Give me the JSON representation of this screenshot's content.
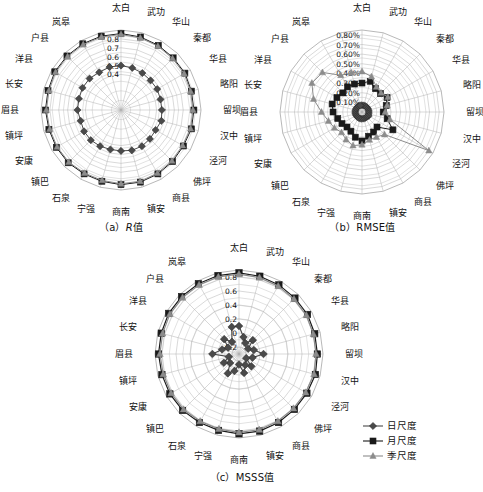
{
  "figure": {
    "panels": [
      {
        "id": "a",
        "caption_prefix": "（a）",
        "caption_metric": "R",
        "caption_suffix": "值"
      },
      {
        "id": "b",
        "caption_prefix": "（b）",
        "caption_metric": "RMSE",
        "caption_suffix": "值"
      },
      {
        "id": "c",
        "caption_prefix": "（c）",
        "caption_metric": "MSSS",
        "caption_suffix": "值"
      }
    ]
  },
  "legend": {
    "position": "bottom-right",
    "items": [
      {
        "label": "日尺度",
        "marker": "diamond-icon",
        "color": "#4a4a4a"
      },
      {
        "label": "月尺度",
        "marker": "square-icon",
        "color": "#1a1a1a"
      },
      {
        "label": "季尺度",
        "marker": "triangle-icon",
        "color": "#8c8c8c"
      }
    ]
  },
  "chart_data": [
    {
      "type": "radar",
      "id": "a",
      "title": "（a）R值",
      "grid": true,
      "legend_position": "external-bottom-right",
      "categories": [
        "太白",
        "武功",
        "华山",
        "秦都",
        "华县",
        "略阳",
        "留坝",
        "汉中",
        "泾河",
        "佛坪",
        "商县",
        "镇安",
        "商南",
        "宁强",
        "石泉",
        "镇巴",
        "安康",
        "镇坪",
        "眉县",
        "长安",
        "洋县",
        "户县",
        "岚皋",
        "太白2"
      ],
      "tick_labels": [
        "0.8",
        "0.7",
        "0.6",
        "0.5",
        "0.4"
      ],
      "rlim": [
        0,
        0.9
      ],
      "rticks": [
        0.8,
        0.7,
        0.6,
        0.5,
        0.4
      ],
      "series": [
        {
          "name": "日尺度",
          "marker": "diamond",
          "color": "#4a4a4a",
          "values": [
            0.5,
            0.49,
            0.48,
            0.47,
            0.47,
            0.46,
            0.46,
            0.47,
            0.45,
            0.46,
            0.47,
            0.47,
            0.46,
            0.46,
            0.47,
            0.48,
            0.48,
            0.47,
            0.49,
            0.49,
            0.5,
            0.5,
            0.49,
            0.5
          ]
        },
        {
          "name": "月尺度",
          "marker": "square",
          "color": "#1a1a1a",
          "values": [
            0.86,
            0.85,
            0.84,
            0.83,
            0.83,
            0.82,
            0.82,
            0.82,
            0.81,
            0.82,
            0.83,
            0.84,
            0.84,
            0.83,
            0.83,
            0.84,
            0.84,
            0.84,
            0.85,
            0.85,
            0.86,
            0.86,
            0.86,
            0.86
          ]
        },
        {
          "name": "季尺度",
          "marker": "triangle",
          "color": "#8c8c8c",
          "values": [
            0.85,
            0.84,
            0.83,
            0.82,
            0.82,
            0.81,
            0.81,
            0.81,
            0.8,
            0.81,
            0.82,
            0.83,
            0.83,
            0.82,
            0.82,
            0.83,
            0.83,
            0.83,
            0.84,
            0.84,
            0.85,
            0.85,
            0.85,
            0.85
          ]
        }
      ]
    },
    {
      "type": "radar",
      "id": "b",
      "title": "（b）RMSE值",
      "grid": true,
      "categories": [
        "太白",
        "武功",
        "华山",
        "秦都",
        "华县",
        "略阳",
        "留坝",
        "汉中",
        "泾河",
        "佛坪",
        "商县",
        "镇安",
        "商南",
        "宁强",
        "石泉",
        "镇巴",
        "安康",
        "镇坪",
        "眉县",
        "长安",
        "洋县",
        "户县",
        "岚皋",
        "太白2"
      ],
      "tick_labels": [
        "0.80%",
        "0.70%",
        "0.60%",
        "0.50%",
        "0.40%",
        "0.30%",
        "0.20%",
        "0.10%"
      ],
      "rlim": [
        0,
        0.85
      ],
      "rticks": [
        0.8,
        0.7,
        0.6,
        0.5,
        0.4,
        0.3,
        0.2,
        0.1
      ],
      "series": [
        {
          "name": "日尺度",
          "marker": "diamond",
          "color": "#4a4a4a",
          "values": [
            0.07,
            0.07,
            0.07,
            0.07,
            0.07,
            0.07,
            0.07,
            0.07,
            0.08,
            0.07,
            0.07,
            0.07,
            0.07,
            0.07,
            0.07,
            0.07,
            0.07,
            0.07,
            0.07,
            0.07,
            0.07,
            0.07,
            0.07,
            0.07
          ]
        },
        {
          "name": "月尺度",
          "marker": "square",
          "color": "#1a1a1a",
          "values": [
            0.3,
            0.33,
            0.28,
            0.27,
            0.3,
            0.26,
            0.22,
            0.27,
            0.37,
            0.22,
            0.24,
            0.26,
            0.3,
            0.27,
            0.23,
            0.22,
            0.24,
            0.26,
            0.3,
            0.32,
            0.3,
            0.28,
            0.3,
            0.3
          ]
        },
        {
          "name": "季尺度",
          "marker": "triangle",
          "color": "#8c8c8c",
          "values": [
            0.42,
            0.38,
            0.3,
            0.28,
            0.31,
            0.27,
            0.24,
            0.3,
            0.8,
            0.33,
            0.3,
            0.3,
            0.34,
            0.36,
            0.33,
            0.3,
            0.33,
            0.36,
            0.42,
            0.52,
            0.6,
            0.58,
            0.44,
            0.42
          ]
        }
      ]
    },
    {
      "type": "radar",
      "id": "c",
      "title": "（c）MSSS值",
      "grid": true,
      "categories": [
        "太白",
        "武功",
        "华山",
        "秦都",
        "华县",
        "略阳",
        "留坝",
        "汉中",
        "泾河",
        "佛坪",
        "商县",
        "镇安",
        "商南",
        "宁强",
        "石泉",
        "镇巴",
        "安康",
        "镇坪",
        "眉县",
        "长安",
        "洋县",
        "户县",
        "岚皋",
        "太白2"
      ],
      "tick_labels": [
        "0.8",
        "0.6",
        "0.4",
        "0.2",
        "0",
        "-0.2"
      ],
      "rlim": [
        -0.3,
        0.9
      ],
      "rticks": [
        0.8,
        0.6,
        0.4,
        0.2,
        0,
        -0.2
      ],
      "series": [
        {
          "name": "日尺度",
          "marker": "diamond",
          "color": "#4a4a4a",
          "values": [
            0.1,
            -0.05,
            -0.12,
            -0.02,
            -0.15,
            -0.08,
            0.05,
            -0.1,
            -0.18,
            -0.05,
            -0.12,
            -0.02,
            -0.15,
            -0.05,
            0.02,
            -0.12,
            -0.05,
            -0.15,
            0.08,
            -0.05,
            -0.12,
            0.0,
            -0.1,
            0.1
          ]
        },
        {
          "name": "月尺度",
          "marker": "square",
          "color": "#1a1a1a",
          "values": [
            0.86,
            0.85,
            0.84,
            0.83,
            0.83,
            0.82,
            0.82,
            0.83,
            0.82,
            0.82,
            0.83,
            0.84,
            0.84,
            0.83,
            0.83,
            0.84,
            0.84,
            0.84,
            0.85,
            0.85,
            0.86,
            0.86,
            0.86,
            0.86
          ]
        },
        {
          "name": "季尺度",
          "marker": "triangle",
          "color": "#8c8c8c",
          "values": [
            0.84,
            0.83,
            0.82,
            0.81,
            0.81,
            0.8,
            0.8,
            0.81,
            0.8,
            0.8,
            0.81,
            0.82,
            0.82,
            0.81,
            0.81,
            0.82,
            0.82,
            0.82,
            0.83,
            0.83,
            0.84,
            0.84,
            0.84,
            0.84
          ]
        }
      ]
    }
  ]
}
